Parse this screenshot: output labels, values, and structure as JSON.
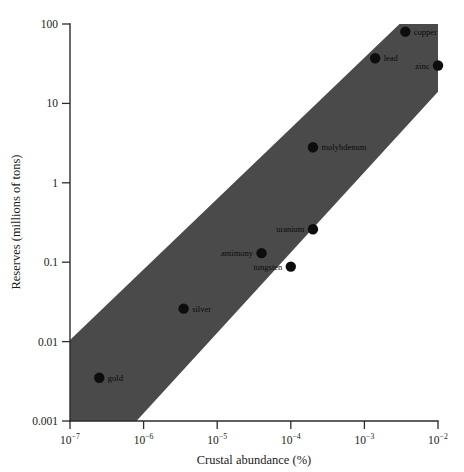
{
  "chart_data": {
    "type": "scatter",
    "title": "",
    "xlabel": "Crustal abundance (%)",
    "ylabel": "Reserves (millions of tons)",
    "xscale": "log",
    "yscale": "log",
    "xlim": [
      1e-07,
      0.01
    ],
    "ylim": [
      0.001,
      100
    ],
    "grid": false,
    "legend": "none",
    "xticklabels": [
      "10−7",
      "10−6",
      "10−5",
      "10−4",
      "10−3",
      "10−2"
    ],
    "xtickvalues": [
      1e-07,
      1e-06,
      1e-05,
      0.0001,
      0.001,
      0.01
    ],
    "yticklabels": [
      "100",
      "10",
      "1",
      "0.1",
      "0.01",
      "0.001"
    ],
    "ytickvalues": [
      100,
      10,
      1,
      0.1,
      0.01,
      0.001
    ],
    "points": [
      {
        "label": "gold",
        "x": 2.5e-07,
        "y": 0.0035,
        "label_side": "right"
      },
      {
        "label": "silver",
        "x": 3.5e-06,
        "y": 0.026,
        "label_side": "right"
      },
      {
        "label": "antimony",
        "x": 4e-05,
        "y": 0.13,
        "label_side": "left"
      },
      {
        "label": "tungsten",
        "x": 0.0001,
        "y": 0.088,
        "label_side": "left"
      },
      {
        "label": "uranium",
        "x": 0.0002,
        "y": 0.26,
        "label_side": "left"
      },
      {
        "label": "molybdenum",
        "x": 0.0002,
        "y": 2.8,
        "label_side": "right"
      },
      {
        "label": "lead",
        "x": 0.0014,
        "y": 37,
        "label_side": "right"
      },
      {
        "label": "copper",
        "x": 0.0036,
        "y": 80,
        "label_side": "right"
      },
      {
        "label": "zinc",
        "x": 0.01,
        "y": 30,
        "label_side": "left"
      }
    ],
    "band": {
      "description": "shaded diagonal band spanning the data trend",
      "fill_color": "#4a4a4a",
      "vertices_data": [
        {
          "x": 1e-07,
          "y": 0.0105
        },
        {
          "x": 0.003,
          "y": 100
        },
        {
          "x": 0.01,
          "y": 100
        },
        {
          "x": 0.01,
          "y": 14
        },
        {
          "x": 8e-07,
          "y": 0.001
        },
        {
          "x": 1e-07,
          "y": 0.001
        }
      ]
    },
    "annotations": []
  },
  "axes": {
    "x_title": "Crustal abundance (%)",
    "y_title": "Reserves (millions of tons)"
  }
}
